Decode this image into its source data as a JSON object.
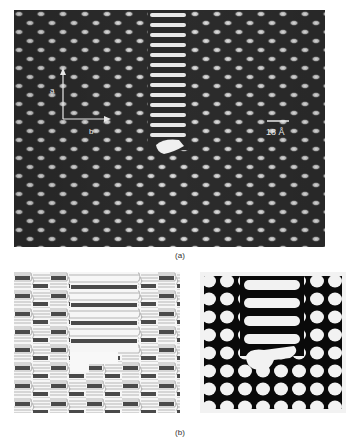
{
  "figure": {
    "panel_a": {
      "caption": "(a)",
      "description": "HRTEM lattice image with planar defect stripe",
      "axes": {
        "vertical_label": "a",
        "horizontal_label": "b"
      },
      "scale_bar": {
        "label": "18 Å"
      }
    },
    "panel_b": {
      "caption": "(b)",
      "left": {
        "description": "Structural model of defect (polyhedral schematic)"
      },
      "right": {
        "description": "Simulated image of defect"
      }
    }
  },
  "colors": {
    "background": "#ffffff",
    "micrograph_dark": "#2a2a2a",
    "micrograph_spot": "#e6e6e6",
    "model_dark_bar": "#4a4a4a",
    "simulation_black": "#0a0a0a"
  }
}
